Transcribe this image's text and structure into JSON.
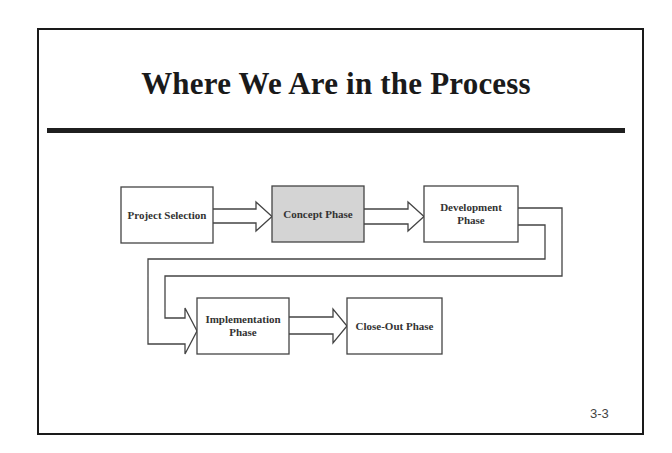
{
  "slide": {
    "title": "Where We Are in the Process",
    "page_number": "3-3"
  },
  "colors": {
    "frame": "#1a1a1a",
    "box_stroke": "#444444",
    "box_fill": "#ffffff",
    "highlight_fill": "#d4d4d4",
    "arrow_stroke": "#444444"
  },
  "diagram": {
    "current_phase": "concept",
    "nodes": [
      {
        "id": "project-selection",
        "label_lines": [
          "Project Selection"
        ],
        "highlighted": false
      },
      {
        "id": "concept",
        "label_lines": [
          "Concept Phase"
        ],
        "highlighted": true
      },
      {
        "id": "development",
        "label_lines": [
          "Development",
          "Phase"
        ],
        "highlighted": false
      },
      {
        "id": "implementation",
        "label_lines": [
          "Implementation",
          "Phase"
        ],
        "highlighted": false
      },
      {
        "id": "close-out",
        "label_lines": [
          "Close-Out Phase"
        ],
        "highlighted": false
      }
    ],
    "edges": [
      {
        "from": "project-selection",
        "to": "concept"
      },
      {
        "from": "concept",
        "to": "development"
      },
      {
        "from": "development",
        "to": "implementation"
      },
      {
        "from": "implementation",
        "to": "close-out"
      }
    ]
  }
}
